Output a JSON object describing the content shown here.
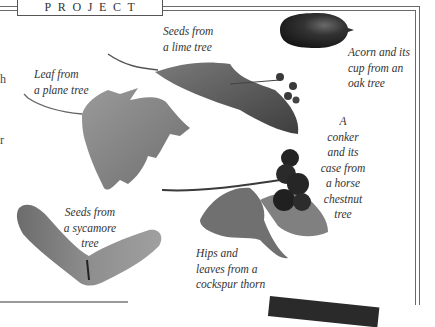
{
  "header": {
    "label": "PROJECT"
  },
  "left_fragments": [
    "h",
    "r"
  ],
  "captions": {
    "lime": [
      "Seeds from",
      "a lime tree"
    ],
    "acorn": [
      "Acorn and its",
      "cup from an",
      "oak tree"
    ],
    "plane": [
      "Leaf from",
      "a plane tree"
    ],
    "conker": [
      "A",
      "conker",
      "and its",
      "case from",
      "a horse",
      "chestnut",
      "tree"
    ],
    "sycamore": [
      "Seeds from",
      "a sycamore",
      "tree"
    ],
    "hips": [
      "Hips and",
      "leaves from a",
      "cockspur thorn"
    ]
  },
  "colors": {
    "border": "#6a6a6a",
    "text": "#333333",
    "acorn": "#2a2a2a",
    "leaf": "#8a8a8a"
  }
}
